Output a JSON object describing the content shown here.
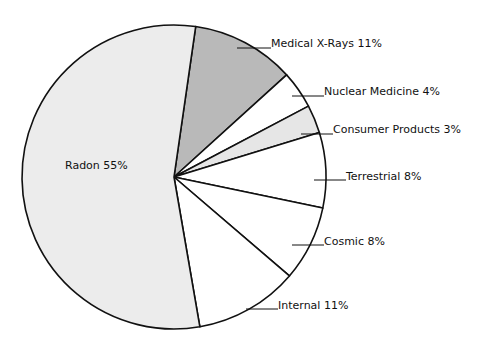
{
  "chart_data": {
    "type": "pie",
    "title": "",
    "start_angle_deg": 8.2,
    "direction": "clockwise",
    "slices": [
      {
        "label": "Medical X-Rays",
        "value": 11,
        "display": "Medical X-Rays 11%",
        "color": "#b9b9b9",
        "label_pos": [
          271,
          47
        ],
        "leader": [
          [
            237,
            48
          ],
          [
            271,
            48
          ]
        ]
      },
      {
        "label": "Nuclear Medicine",
        "value": 4,
        "display": "Nuclear Medicine 4%",
        "color": "#ffffff",
        "label_pos": [
          324,
          95
        ],
        "leader": [
          [
            292,
            96
          ],
          [
            324,
            96
          ]
        ]
      },
      {
        "label": "Consumer Products",
        "value": 3,
        "display": "Consumer Products 3%",
        "color": "#e6e6e6",
        "label_pos": [
          333,
          133
        ],
        "leader": [
          [
            301,
            134
          ],
          [
            333,
            134
          ]
        ]
      },
      {
        "label": "Terrestrial",
        "value": 8,
        "display": "Terrestrial 8%",
        "color": "#ffffff",
        "label_pos": [
          346,
          180
        ],
        "leader": [
          [
            314,
            180
          ],
          [
            346,
            180
          ]
        ]
      },
      {
        "label": "Cosmic",
        "value": 8,
        "display": "Cosmic 8%",
        "color": "#ffffff",
        "label_pos": [
          324,
          245
        ],
        "leader": [
          [
            292,
            245
          ],
          [
            324,
            245
          ]
        ]
      },
      {
        "label": "Internal",
        "value": 11,
        "display": "Internal 11%",
        "color": "#ffffff",
        "label_pos": [
          278,
          309
        ],
        "leader": [
          [
            246,
            309
          ],
          [
            278,
            309
          ]
        ]
      },
      {
        "label": "Radon",
        "value": 55,
        "display": "Radon 55%",
        "color": "#ececec",
        "label_pos": [
          65,
          169
        ],
        "leader": null
      }
    ],
    "center": [
      174,
      177
    ],
    "radius": 152,
    "legend": null
  }
}
